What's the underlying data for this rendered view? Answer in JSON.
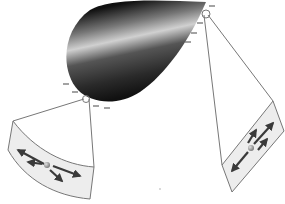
{
  "diagram": {
    "conductor": {
      "shape": "cone",
      "shade_dark": "#1a1a1a",
      "shade_light": "#d8d8d8"
    },
    "charges": {
      "symbol": "minus",
      "left_contact": [
        [
          67,
          84
        ],
        [
          75,
          92
        ],
        [
          96,
          106
        ],
        [
          107,
          108
        ]
      ],
      "right_contact": [
        [
          212,
          6
        ],
        [
          200,
          23
        ],
        [
          194,
          33
        ],
        [
          188,
          42
        ]
      ]
    },
    "panels": [
      {
        "id": "left",
        "pivot": [
          86,
          99
        ],
        "field_pattern": "radial/diverging",
        "arrow_count": 4
      },
      {
        "id": "right",
        "pivot": [
          206,
          15
        ],
        "field_pattern": "parallel",
        "arrow_count": 4
      }
    ],
    "colors": {
      "line": "#777777",
      "panel_fill": "#ededed",
      "arrow": "#3a3a3a",
      "charge_ball": "#9a9a9a"
    }
  }
}
